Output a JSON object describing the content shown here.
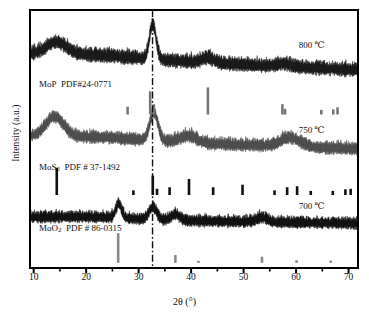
{
  "chart_data": {
    "type": "line",
    "title": "",
    "xlabel": "2θ (°)",
    "ylabel": "Intensity (a.u.)",
    "xlim": [
      9.3,
      71.8
    ],
    "ylim": [
      0,
      1
    ],
    "grid": false,
    "legend_position": "inline-right",
    "xticks": [
      10,
      20,
      30,
      40,
      50,
      60,
      70
    ],
    "xtick_labels": [
      "10",
      "20",
      "30",
      "40",
      "50",
      "60",
      "70"
    ],
    "yticks": [],
    "ytick_labels": [],
    "annotations": {
      "marker_line_2theta": 32.65,
      "marker_line_style": "dash-dot",
      "marker_line_color": "#111111"
    },
    "series": [
      {
        "name": "800 ℃",
        "label": "800 ℃",
        "color": "#1a1a1a",
        "baseline_y": 0.82,
        "noise_amplitude": 0.055,
        "peaks": [
          {
            "x": 14.4,
            "height": 0.045,
            "width": 2.6
          },
          {
            "x": 32.7,
            "height": 0.135,
            "width": 0.9
          },
          {
            "x": 43.2,
            "height": 0.02,
            "width": 1.6
          },
          {
            "x": 57.6,
            "height": 0.012,
            "width": 1.8
          }
        ],
        "background_slope": -0.06,
        "label_x": 60.5,
        "label_y": 0.845
      },
      {
        "name": "750 ℃",
        "label": "750 ℃",
        "color": "#4d4d4d",
        "baseline_y": 0.5,
        "noise_amplitude": 0.05,
        "peaks": [
          {
            "x": 14.0,
            "height": 0.075,
            "width": 2.4
          },
          {
            "x": 32.9,
            "height": 0.11,
            "width": 1.1
          },
          {
            "x": 39.5,
            "height": 0.026,
            "width": 2.2
          },
          {
            "x": 58.9,
            "height": 0.034,
            "width": 2.6
          }
        ],
        "background_slope": -0.045,
        "label_x": 60.5,
        "label_y": 0.515
      },
      {
        "name": "700 ℃",
        "label": "700 ℃",
        "color": "#111111",
        "baseline_y": 0.185,
        "noise_amplitude": 0.046,
        "peaks": [
          {
            "x": 26.2,
            "height": 0.055,
            "width": 0.8
          },
          {
            "x": 32.7,
            "height": 0.048,
            "width": 1.0
          },
          {
            "x": 37.0,
            "height": 0.022,
            "width": 1.2
          },
          {
            "x": 53.5,
            "height": 0.018,
            "width": 1.4
          }
        ],
        "background_slope": -0.018,
        "label_x": 60.5,
        "label_y": 0.222
      }
    ],
    "reference_patterns": [
      {
        "name": "MoP",
        "formula": "MoP",
        "formula_base": "MoP",
        "formula_sub": "",
        "pdf_text": "PDF#24-0771",
        "color": "#777777",
        "label_x": 11.0,
        "label_y": 0.695,
        "stick_baseline_y": 0.595,
        "sticks": [
          {
            "x": 27.9,
            "h": 0.03
          },
          {
            "x": 32.2,
            "h": 0.09
          },
          {
            "x": 32.9,
            "h": 0.04
          },
          {
            "x": 43.2,
            "h": 0.105
          },
          {
            "x": 57.4,
            "h": 0.04
          },
          {
            "x": 57.9,
            "h": 0.022
          },
          {
            "x": 64.8,
            "h": 0.018
          },
          {
            "x": 67.1,
            "h": 0.02
          },
          {
            "x": 67.9,
            "h": 0.028
          }
        ]
      },
      {
        "name": "MoS2",
        "formula": "MoS₂",
        "formula_base": "MoS",
        "formula_sub": "2",
        "pdf_text": "PDF  # 37-1492",
        "color": "#111111",
        "label_x": 11.0,
        "label_y": 0.372,
        "stick_baseline_y": 0.283,
        "sticks": [
          {
            "x": 14.4,
            "h": 0.105
          },
          {
            "x": 29.0,
            "h": 0.018
          },
          {
            "x": 32.7,
            "h": 0.075
          },
          {
            "x": 33.5,
            "h": 0.024
          },
          {
            "x": 35.9,
            "h": 0.03
          },
          {
            "x": 39.6,
            "h": 0.062
          },
          {
            "x": 44.2,
            "h": 0.03
          },
          {
            "x": 49.8,
            "h": 0.04
          },
          {
            "x": 55.9,
            "h": 0.018
          },
          {
            "x": 58.3,
            "h": 0.03
          },
          {
            "x": 60.2,
            "h": 0.034
          },
          {
            "x": 62.8,
            "h": 0.016
          },
          {
            "x": 67.0,
            "h": 0.016
          },
          {
            "x": 69.4,
            "h": 0.022
          },
          {
            "x": 70.4,
            "h": 0.024
          }
        ]
      },
      {
        "name": "MoO2",
        "formula": "MoO₂",
        "formula_base": "MoO",
        "formula_sub": "2",
        "pdf_text": "PDF   # 86-0315",
        "color": "#888888",
        "label_x": 11.0,
        "label_y": 0.135,
        "stick_baseline_y": 0.02,
        "sticks": [
          {
            "x": 26.1,
            "h": 0.115
          },
          {
            "x": 37.0,
            "h": 0.03
          },
          {
            "x": 41.4,
            "h": 0.008
          },
          {
            "x": 53.5,
            "h": 0.024
          },
          {
            "x": 60.1,
            "h": 0.01
          },
          {
            "x": 66.6,
            "h": 0.009
          }
        ]
      }
    ]
  },
  "axes": {
    "xlabel_theta": "2θ (°)",
    "ylabel": "Intensity (a.u.)",
    "tick_labels": [
      "10",
      "20",
      "30",
      "40",
      "50",
      "60",
      "70"
    ]
  }
}
